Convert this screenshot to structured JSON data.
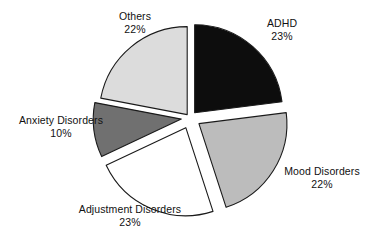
{
  "chart_data": {
    "type": "pie",
    "title": "",
    "subtitle": "",
    "xlabel": "",
    "ylabel": "",
    "legend_position": "none",
    "grid": false,
    "exploded": true,
    "labels_show_percent": true,
    "categories": [
      "ADHD",
      "Mood Disorders",
      "Adjustment Disorders",
      "Anxiety Disorders",
      "Others"
    ],
    "values": [
      23,
      22,
      23,
      10,
      22
    ],
    "slices": [
      {
        "name": "ADHD",
        "label": "ADHD",
        "percent": 23,
        "percent_text": "23%",
        "color": "#0d0d0d",
        "outline": "#1a1a1a",
        "start_angle_deg": 0,
        "end_angle_deg": 82.8,
        "explode": 0.08
      },
      {
        "name": "Mood Disorders",
        "label": "Mood Disorders",
        "percent": 22,
        "percent_text": "22%",
        "color": "#bcbcbc",
        "outline": "#1a1a1a",
        "start_angle_deg": 82.8,
        "end_angle_deg": 162.0,
        "explode": 0.12
      },
      {
        "name": "Adjustment Disorders",
        "label": "Adjustment Disorders",
        "percent": 23,
        "percent_text": "23%",
        "color": "#ffffff",
        "outline": "#1a1a1a",
        "start_angle_deg": 162.0,
        "end_angle_deg": 244.8,
        "explode": 0.12
      },
      {
        "name": "Anxiety Disorders",
        "label": "Anxiety Disorders",
        "percent": 10,
        "percent_text": "10%",
        "color": "#707070",
        "outline": "#1a1a1a",
        "start_angle_deg": 244.8,
        "end_angle_deg": 280.8,
        "explode": 0.1
      },
      {
        "name": "Others",
        "label": "Others",
        "percent": 22,
        "percent_text": "22%",
        "color": "#dcdcdc",
        "outline": "#1a1a1a",
        "start_angle_deg": 280.8,
        "end_angle_deg": 360.0,
        "explode": 0.05
      }
    ],
    "geometry": {
      "center_x": 190,
      "center_y": 118,
      "radius": 88
    }
  }
}
